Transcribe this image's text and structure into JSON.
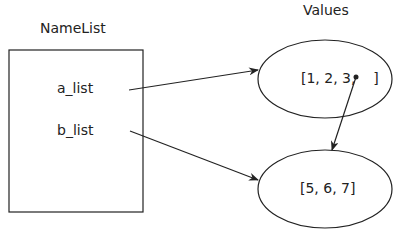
{
  "titles": {
    "namelist": "NameList",
    "values": "Values"
  },
  "names": [
    {
      "label": "a_list"
    },
    {
      "label": "b_list"
    }
  ],
  "values": [
    {
      "text": "[1, 2, 3,    ]"
    },
    {
      "text": "[5, 6, 7]"
    }
  ],
  "colors": {
    "stroke": "#222222",
    "background": "#ffffff"
  }
}
